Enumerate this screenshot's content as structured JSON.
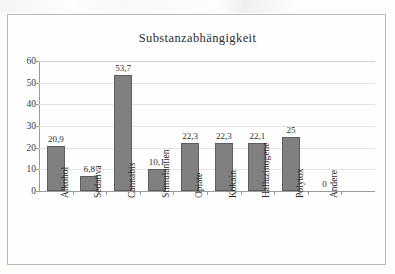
{
  "chart_data": {
    "type": "bar",
    "title": "Substanzabhängigkeit",
    "xlabel": "",
    "ylabel": "",
    "ylim": [
      0,
      60
    ],
    "ytick_step": 10,
    "yticks": [
      0,
      10,
      20,
      30,
      40,
      50,
      60
    ],
    "grid": true,
    "legend": "none",
    "bar_color": "#808080",
    "bar_border_color": "#5d5d5d",
    "grid_color": "#e3e3e3",
    "axis_color": "#9a9a9a",
    "frame_color": "#b9b9b9",
    "categories": [
      "Alkohol",
      "Sedativa",
      "Cannabis",
      "Stimulantien",
      "Opiate",
      "Kokain",
      "Halluzinogene",
      "Polytox",
      "Andere"
    ],
    "values": [
      20.9,
      6.8,
      53.7,
      10.1,
      22.3,
      22.3,
      22.1,
      25,
      0
    ],
    "value_labels": [
      "20,9",
      "6,8",
      "53,7",
      "10,1",
      "22,3",
      "22,3",
      "22,1",
      "25",
      "0"
    ],
    "ytick_labels": [
      "0",
      "10",
      "20",
      "30",
      "40",
      "50",
      "60"
    ]
  }
}
